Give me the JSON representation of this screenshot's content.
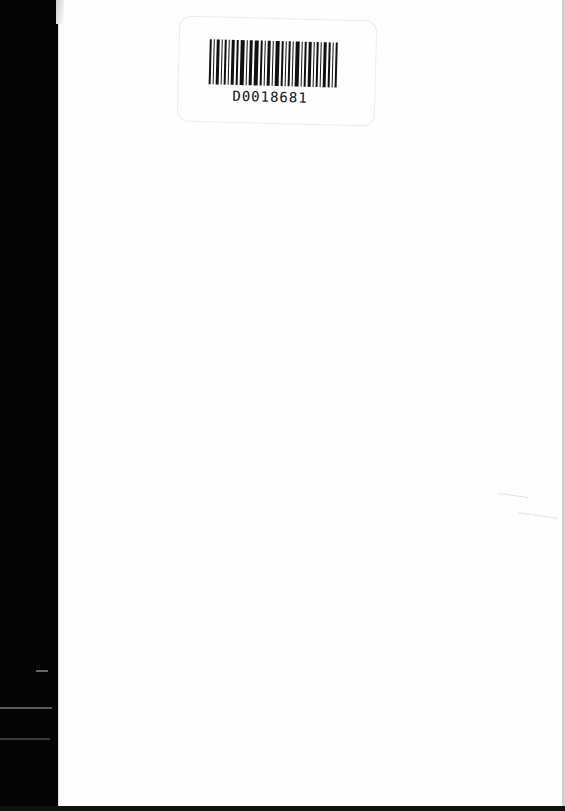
{
  "document": {
    "type": "scanned-page",
    "barcode_label": {
      "number": "D0018681"
    }
  },
  "colors": {
    "background": "#000000",
    "page": "#fdfdfd",
    "ink": "#111111"
  }
}
